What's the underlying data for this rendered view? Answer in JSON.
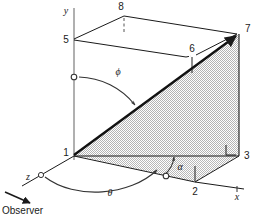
{
  "figure": {
    "background_color": "#ffffff",
    "line_color": "#1a1a1a",
    "thin_line_color": "#555555",
    "shade_fill": "#d6d6d6",
    "axes": [
      {
        "name": "y-axis",
        "label": "y"
      },
      {
        "name": "x-axis",
        "label": "x"
      },
      {
        "name": "z-axis",
        "label": "z"
      }
    ],
    "vertices": [
      {
        "id": "1",
        "label": "1",
        "x": 74,
        "y": 155
      },
      {
        "id": "2",
        "label": "2",
        "x": 195,
        "y": 182
      },
      {
        "id": "3",
        "label": "3",
        "x": 239,
        "y": 155
      },
      {
        "id": "5",
        "label": "5",
        "x": 74,
        "y": 39
      },
      {
        "id": "6",
        "label": "6",
        "x": 192,
        "y": 54
      },
      {
        "id": "7",
        "label": "7",
        "x": 239,
        "y": 33
      },
      {
        "id": "8",
        "label": "8",
        "x": 124,
        "y": 11
      }
    ],
    "angles": [
      {
        "name": "phi",
        "label": "ϕ"
      },
      {
        "name": "theta",
        "label": "θ"
      },
      {
        "name": "alpha",
        "label": "α"
      }
    ],
    "annotations": [
      {
        "name": "observer",
        "label": "Observer"
      }
    ],
    "right_angle_marker": {
      "name": "right-angle-at-3",
      "present": true
    }
  }
}
